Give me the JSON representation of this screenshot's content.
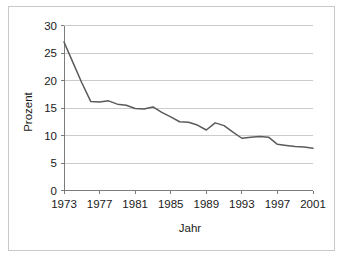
{
  "chart_data": {
    "type": "line",
    "title": "",
    "xlabel": "Jahr",
    "ylabel": "Prozent",
    "xlim": [
      1973,
      2001
    ],
    "ylim": [
      0,
      30
    ],
    "yticks": [
      0,
      5,
      10,
      15,
      20,
      25,
      30
    ],
    "xticks": [
      1973,
      1977,
      1981,
      1985,
      1989,
      1993,
      1997,
      2001
    ],
    "grid": "horizontal",
    "legend": "none",
    "line_color": "#5a5a5a",
    "frame_color": "#c9c9c9",
    "x": [
      1973,
      1974,
      1975,
      1976,
      1977,
      1978,
      1979,
      1980,
      1981,
      1982,
      1983,
      1984,
      1985,
      1986,
      1987,
      1988,
      1989,
      1990,
      1991,
      1992,
      1993,
      1994,
      1995,
      1996,
      1997,
      1998,
      1999,
      2000,
      2001
    ],
    "series": [
      {
        "name": "Prozent",
        "values": [
          27.0,
          23.3,
          19.6,
          16.2,
          16.1,
          16.3,
          15.7,
          15.5,
          14.9,
          14.8,
          15.2,
          14.2,
          13.4,
          12.5,
          12.4,
          11.9,
          11.0,
          12.3,
          11.8,
          10.6,
          9.5,
          9.7,
          9.8,
          9.7,
          8.4,
          8.2,
          8.0,
          7.9,
          7.7
        ]
      }
    ],
    "xticklabels": [
      "1973",
      "1977",
      "1981",
      "1985",
      "1989",
      "1993",
      "1997",
      "2001"
    ],
    "yticklabels": [
      "0",
      "5",
      "10",
      "15",
      "20",
      "25",
      "30"
    ]
  }
}
